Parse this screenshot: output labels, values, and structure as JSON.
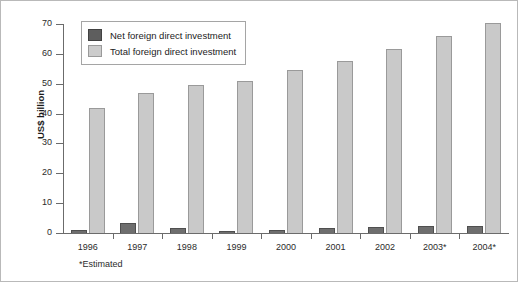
{
  "chart_data": {
    "type": "bar",
    "title": "",
    "xlabel": "",
    "ylabel": "US$ billion",
    "ylim": [
      0,
      70
    ],
    "yticks": [
      0,
      10,
      20,
      30,
      40,
      50,
      60,
      70
    ],
    "grid": false,
    "legend_position": "top-left-inside",
    "categories": [
      "1996",
      "1997",
      "1998",
      "1999",
      "2000",
      "2001",
      "2002",
      "2003*",
      "2004*"
    ],
    "series": [
      {
        "name": "Net foreign direct investment",
        "color": "#5e5e5e",
        "values": [
          1.0,
          3.5,
          1.7,
          0.5,
          1.0,
          1.6,
          2.0,
          2.2,
          2.4
        ]
      },
      {
        "name": "Total foreign direct investment",
        "color": "#cccccc",
        "values": [
          42,
          47,
          49.5,
          51,
          54.5,
          57.5,
          61.5,
          66,
          70.5
        ]
      }
    ],
    "footnote": "*Estimated"
  },
  "legend": {
    "items": [
      {
        "label": "Net foreign direct investment",
        "swatch": "net"
      },
      {
        "label": "Total foreign direct investment",
        "swatch": "total"
      }
    ]
  }
}
